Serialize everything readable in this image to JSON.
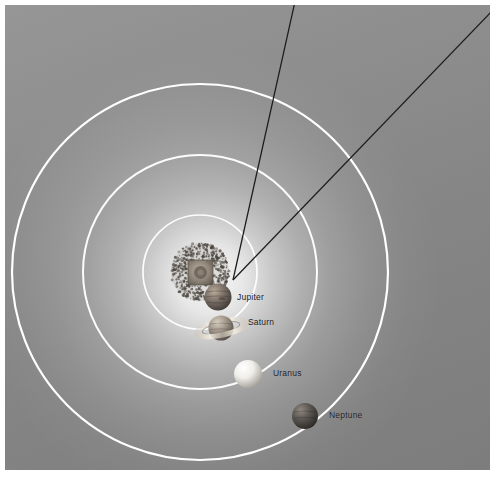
{
  "figure": {
    "background_color": "#8e8e8e",
    "panel_border_color": "#ffffff",
    "orbit_color": "#ffffff",
    "label_color": "#20201f",
    "callout_line_color": "#1c1c1c"
  },
  "center": {
    "x": 195,
    "y": 267,
    "inset_label": "inner-solar-system-inset"
  },
  "orbits": [
    {
      "name": "jupiter-orbit",
      "radius": 57
    },
    {
      "name": "saturn-orbit",
      "radius": 117
    },
    {
      "name": "uranus-neptune-orbit",
      "radius": 188
    }
  ],
  "bodies": [
    {
      "name": "asteroid-belt",
      "label": "",
      "x": 195,
      "y": 267,
      "radius": 30,
      "color": "#6f6a63"
    },
    {
      "name": "jupiter",
      "label": "Jupiter",
      "x": 213,
      "y": 292,
      "radius": 13.5,
      "color": "#6b625a",
      "label_x": 232,
      "label_y": 288
    },
    {
      "name": "saturn",
      "label": "Saturn",
      "x": 216,
      "y": 323,
      "radius": 13,
      "color": "#8e857a",
      "label_x": 243,
      "label_y": 313,
      "has_rings": true
    },
    {
      "name": "uranus",
      "label": "Uranus",
      "x": 243,
      "y": 369,
      "radius": 14,
      "color": "#eceae4",
      "label_x": 268,
      "label_y": 367
    },
    {
      "name": "neptune",
      "label": "Neptune",
      "x": 300,
      "y": 411,
      "radius": 13,
      "color": "#4e4a47",
      "label_x": 324,
      "label_y": 410
    }
  ],
  "callouts": [
    {
      "name": "callout-line-left",
      "x1": 228,
      "y1": 275,
      "x2": 291,
      "y2": -6
    },
    {
      "name": "callout-line-right",
      "x1": 228,
      "y1": 275,
      "x2": 487,
      "y2": 6
    }
  ]
}
